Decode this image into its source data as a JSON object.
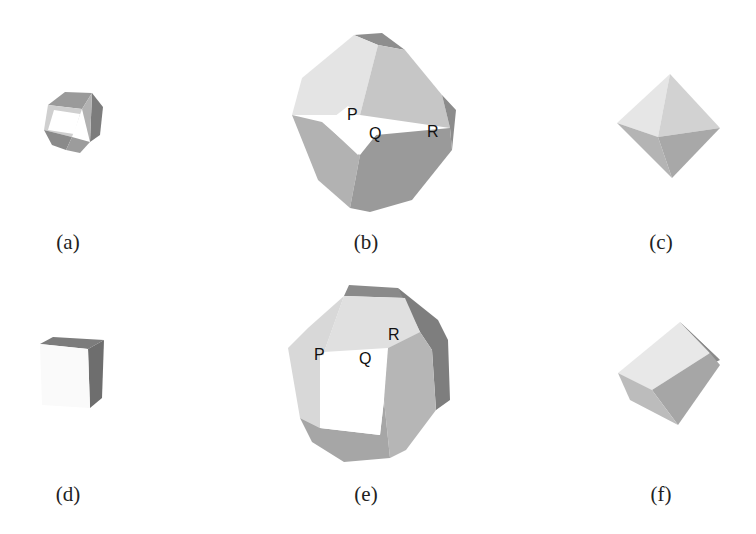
{
  "figure": {
    "panels": [
      {
        "id": "a",
        "caption": "(a)",
        "shape": "cuboctahedron-small",
        "vertex_labels": []
      },
      {
        "id": "b",
        "caption": "(b)",
        "shape": "truncated-octahedron-like",
        "vertex_labels": [
          "P",
          "Q",
          "R"
        ]
      },
      {
        "id": "c",
        "caption": "(c)",
        "shape": "octahedron",
        "vertex_labels": []
      },
      {
        "id": "d",
        "caption": "(d)",
        "shape": "cube-corner",
        "vertex_labels": []
      },
      {
        "id": "e",
        "caption": "(e)",
        "shape": "truncated-cube-like",
        "vertex_labels": [
          "P",
          "Q",
          "R"
        ]
      },
      {
        "id": "f",
        "caption": "(f)",
        "shape": "cube",
        "vertex_labels": []
      }
    ],
    "colors": {
      "face_light": "#e4e4e4",
      "face_mid": "#c2c2c2",
      "face_dark": "#9a9a9a",
      "face_darker": "#7c7c7c",
      "face_white": "#ffffff"
    }
  }
}
